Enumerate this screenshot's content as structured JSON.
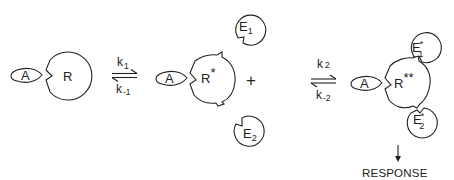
{
  "diagram": {
    "type": "reaction-scheme",
    "stage1": {
      "agonist": "A",
      "receptor": "R"
    },
    "equilibrium1": {
      "forward_rate": "k",
      "forward_sub": "1",
      "reverse_rate": "k",
      "reverse_sub": "-1"
    },
    "stage2": {
      "agonist": "A",
      "receptor": "R",
      "receptor_mark": "*",
      "plus": "+",
      "effector1": "E",
      "effector1_sub": "1",
      "effector2": "E",
      "effector2_sub": "2"
    },
    "equilibrium2": {
      "forward_rate": "k",
      "forward_sub": "2",
      "reverse_rate": "k",
      "reverse_sub": "-2"
    },
    "stage3": {
      "agonist": "A",
      "receptor": "R",
      "receptor_mark": "**",
      "effector1": "E",
      "effector1_mark": "*",
      "effector1_sub": "1",
      "effector2": "E",
      "effector2_mark": "*",
      "effector2_sub": "2"
    },
    "output": {
      "label": "RESPONSE"
    },
    "colors": {
      "stroke": "#222222",
      "background": "#ffffff"
    }
  }
}
